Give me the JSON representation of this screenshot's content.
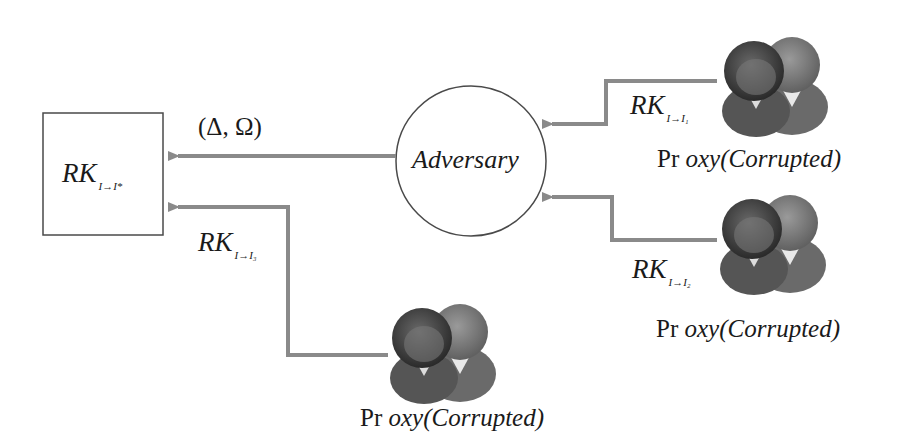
{
  "diagram": {
    "target_box": {
      "label": "RK",
      "subscript": "I→I*"
    },
    "adversary": {
      "label": "Adversary"
    },
    "output_label": "(Δ, Ω)",
    "proxies": [
      {
        "id": "proxy1",
        "key_label": "RK",
        "key_subscript": "I→I₁",
        "name_prefix": "Pr",
        "name_rest": "oxy",
        "status": "(Corrupted)"
      },
      {
        "id": "proxy2",
        "key_label": "RK",
        "key_subscript": "I→I₂",
        "name_prefix": "Pr",
        "name_rest": "oxy",
        "status": "(Corrupted)"
      },
      {
        "id": "proxy3",
        "key_label": "RK",
        "key_subscript": "I→I₃",
        "name_prefix": "Pr",
        "name_rest": "oxy",
        "status": "(Corrupted)"
      }
    ],
    "colors": {
      "arrow": "#8a8a8a",
      "stroke": "#4a4a4a",
      "text": "#1a1a1a"
    }
  }
}
